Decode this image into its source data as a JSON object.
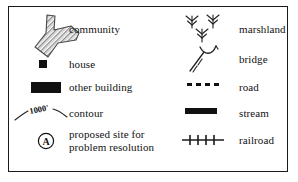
{
  "legend": {
    "columns": [
      {
        "id": "left",
        "entries": [
          {
            "symbol": "community-polygon-icon",
            "label": "community"
          },
          {
            "symbol": "house-square-icon",
            "label": "house"
          },
          {
            "symbol": "other-building-rect-icon",
            "label": "other building"
          },
          {
            "symbol": "contour-line-icon",
            "label": "contour",
            "annotation": "1000'"
          },
          {
            "symbol": "circled-a-icon",
            "label": "proposed site for",
            "label2": "problem resolution",
            "marker": "A"
          }
        ]
      },
      {
        "id": "right",
        "entries": [
          {
            "symbol": "marshland-grass-icon",
            "label": "marshland"
          },
          {
            "symbol": "bridge-icon",
            "label": "bridge"
          },
          {
            "symbol": "road-dashed-icon",
            "label": "road"
          },
          {
            "symbol": "stream-bar-icon",
            "label": "stream"
          },
          {
            "symbol": "railroad-crosstie-icon",
            "label": "railroad"
          }
        ]
      }
    ]
  },
  "colors": {
    "ink": "#111111",
    "border": "#1a1a1a",
    "background": "#ffffff"
  }
}
